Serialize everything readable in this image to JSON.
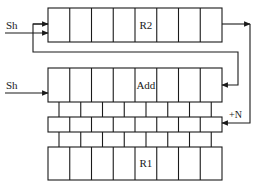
{
  "diagram": {
    "type": "register shift-add block diagram",
    "registers": [
      {
        "id": "R2",
        "label": "R2",
        "cells": 8,
        "label_cell": 5
      },
      {
        "id": "Add",
        "label": "Add",
        "cells": 8,
        "label_cell": 5
      },
      {
        "id": "R1",
        "label": "R1",
        "cells": 8,
        "label_cell": 5
      }
    ],
    "inputs": [
      {
        "label": "Sh",
        "target": "R2"
      },
      {
        "label": "Sh",
        "target": "Add"
      }
    ],
    "feedback_label": "+N",
    "partial_product_rows": 3,
    "colors": {
      "line": "#1a1a1a",
      "background": "#ffffff"
    }
  }
}
